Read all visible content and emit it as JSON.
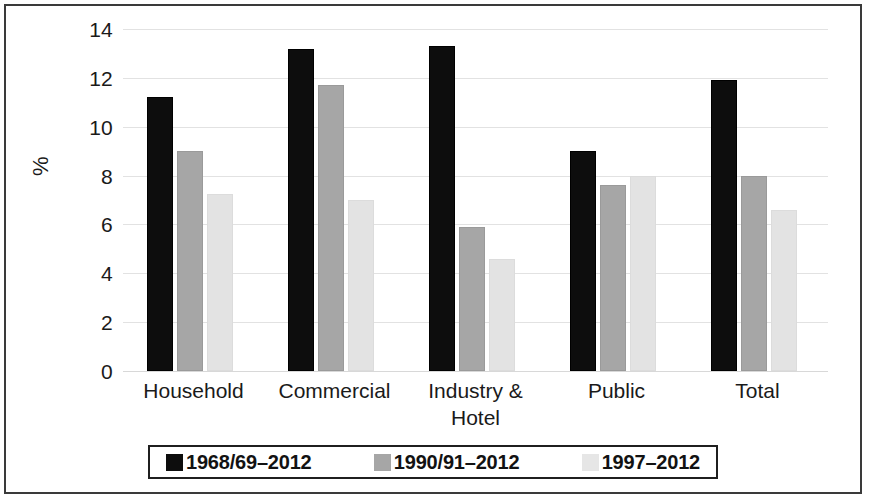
{
  "chart_data": {
    "type": "bar",
    "title": "",
    "subtitle": "",
    "xlabel": "",
    "ylabel": "%",
    "ylim": [
      0,
      14
    ],
    "ytick_step": 2,
    "yticks": [
      "14",
      "12",
      "10",
      "8",
      "6",
      "4",
      "2",
      "0"
    ],
    "grid": true,
    "legend_position": "bottom",
    "categories": [
      "Household",
      "Commercial",
      "Industry &\nHotel",
      "Public",
      "Total"
    ],
    "series": [
      {
        "name": "1968/69–2012",
        "color": "#0d0d0d",
        "values": [
          11.2,
          13.2,
          13.3,
          9.0,
          11.9
        ]
      },
      {
        "name": "1990/91–2012",
        "color": "#a6a6a6",
        "values": [
          9.0,
          11.7,
          5.9,
          7.6,
          8.0
        ]
      },
      {
        "name": "1997–2012",
        "color": "#e3e3e3",
        "values": [
          7.25,
          7.0,
          4.6,
          8.0,
          6.6
        ]
      }
    ]
  },
  "axis": {
    "y_title": "%",
    "y_ticks": [
      "14",
      "12",
      "10",
      "8",
      "6",
      "4",
      "2",
      "0"
    ]
  },
  "categories": [
    {
      "label": "Household"
    },
    {
      "label": "Commercial"
    },
    {
      "label": "Industry &\nHotel"
    },
    {
      "label": "Public"
    },
    {
      "label": "Total"
    }
  ],
  "legend": {
    "items": [
      {
        "label": "1968/69–2012",
        "swatch": "black-swatch"
      },
      {
        "label": "1990/91–2012",
        "swatch": "gray-swatch"
      },
      {
        "label": "1997–2012",
        "swatch": "light-gray-swatch"
      }
    ]
  }
}
